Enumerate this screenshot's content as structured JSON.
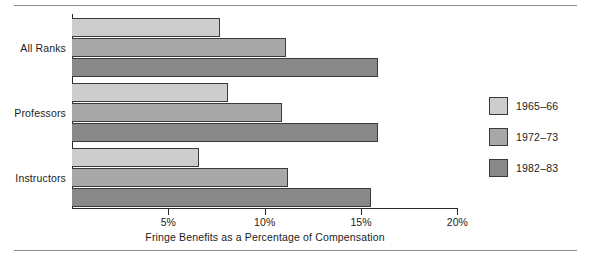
{
  "chart_data": {
    "type": "bar",
    "orientation": "horizontal",
    "title": "",
    "xlabel": "Fringe Benefits as a Percentage of Compensation",
    "ylabel": "",
    "categories": [
      "All Ranks",
      "Professors",
      "Instructors"
    ],
    "series": [
      {
        "name": "1965–66",
        "color": "#cdcdcd",
        "values": [
          7.7,
          8.1,
          6.6
        ]
      },
      {
        "name": "1972–73",
        "color": "#a8a8a8",
        "values": [
          11.1,
          10.9,
          11.2
        ]
      },
      {
        "name": "1982–83",
        "color": "#898989",
        "values": [
          15.9,
          15.9,
          15.5
        ]
      }
    ],
    "xlim": [
      0,
      20
    ],
    "xticks": [
      5,
      10,
      15,
      20
    ],
    "xtick_labels": [
      "5%",
      "10%",
      "15%",
      "20%"
    ],
    "grid": false,
    "legend_position": "right"
  },
  "legend": {
    "entries": [
      {
        "label": "1965–66"
      },
      {
        "label": "1972–73"
      },
      {
        "label": "1982–83"
      }
    ]
  },
  "axis": {
    "x_title": "Fringe Benefits as a Percentage of Compensation",
    "tick_labels": [
      "5%",
      "10%",
      "15%",
      "20%"
    ]
  },
  "groups": [
    {
      "label": "All Ranks"
    },
    {
      "label": "Professors"
    },
    {
      "label": "Instructors"
    }
  ]
}
